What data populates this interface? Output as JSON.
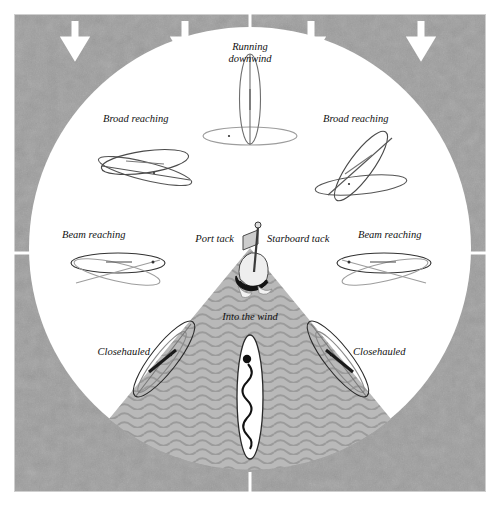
{
  "figure": {
    "colors": {
      "background_field": "#9a9a9a",
      "field_texture_light": "#a6a6a6",
      "circle": "#ffffff",
      "no_go_zone": "#b4b4b4",
      "no_go_wave": "#9c9c9c",
      "arrow": "#ffffff",
      "line": "#1a1a1a",
      "hull_light": "#d8d8d8",
      "border": "#c8c8c8",
      "registration_mark": "#ffffff",
      "page": "#ffffff"
    },
    "wind": {
      "direction": "from top",
      "arrow_count": 4,
      "arrow_icon": "arrow-down-icon",
      "arrow_x": [
        75,
        185,
        311,
        421
      ]
    },
    "registration_marks": [
      "top-center",
      "bottom-center",
      "left-middle",
      "right-middle"
    ]
  },
  "labels": {
    "running_downwind_line1": "Running",
    "running_downwind_line2": "downwind",
    "broad_reaching_left": "Broad reaching",
    "broad_reaching_right": "Broad reaching",
    "beam_reaching_left": "Beam reaching",
    "beam_reaching_right": "Beam reaching",
    "closehauled_left": "Closehauled",
    "closehauled_right": "Closehauled",
    "into_the_wind": "Into the wind",
    "port_tack": "Port tack",
    "starboard_tack": "Starboard tack"
  },
  "points_of_sail": [
    {
      "name": "Running downwind",
      "bearing_deg": 0,
      "position": "top"
    },
    {
      "name": "Broad reaching",
      "bearing_deg": 315,
      "position": "upper-left"
    },
    {
      "name": "Broad reaching",
      "bearing_deg": 45,
      "position": "upper-right"
    },
    {
      "name": "Beam reaching",
      "bearing_deg": 270,
      "position": "left"
    },
    {
      "name": "Beam reaching",
      "bearing_deg": 90,
      "position": "right"
    },
    {
      "name": "Closehauled",
      "bearing_deg": 225,
      "position": "lower-left"
    },
    {
      "name": "Closehauled",
      "bearing_deg": 135,
      "position": "lower-right"
    },
    {
      "name": "Into the wind",
      "bearing_deg": 180,
      "position": "bottom"
    }
  ],
  "tacks": {
    "port": "Port tack",
    "starboard": "Starboard tack",
    "center_icon": "boat-stern-compass-icon"
  },
  "no_go_zone": {
    "label": "Into the wind",
    "half_angle_deg": 45,
    "texture": "wavy-lines"
  }
}
